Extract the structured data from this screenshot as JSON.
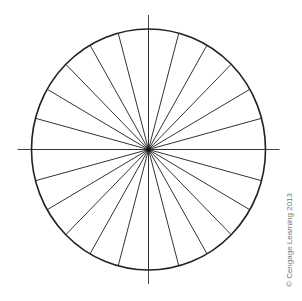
{
  "diagram": {
    "type": "polar-grid",
    "center": [
      148.5,
      149.5
    ],
    "radius_x": 117,
    "radius_y": 120.5,
    "spoke_count": 24,
    "spoke_angle_step_deg": 15,
    "axis_extension": 14,
    "colors": {
      "circle": "#222222",
      "spokes": "#333333",
      "axes": "#444444",
      "background": "#ffffff"
    }
  },
  "credit": {
    "text": "© Cengage Learning 2013"
  }
}
